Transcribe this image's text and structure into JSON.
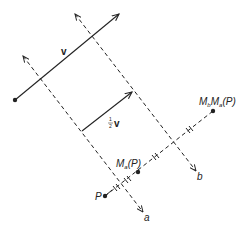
{
  "diagram": {
    "labels": {
      "v": "v",
      "half_v_num": "1",
      "half_v_den": "2",
      "half_v_vec": "v",
      "P": "P",
      "Ma_M": "M",
      "Ma_sub": "a",
      "Ma_arg": "(P)",
      "MbMa_M1": "M",
      "MbMa_sub1": "b",
      "MbMa_M2": "M",
      "MbMa_sub2": "a",
      "MbMa_arg": "(P)",
      "line_a": "a",
      "line_b": "b"
    },
    "colors": {
      "ink": "#222222",
      "background": "#ffffff"
    }
  }
}
